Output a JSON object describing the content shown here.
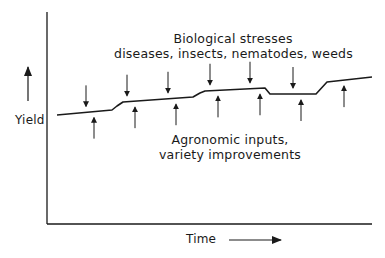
{
  "diagram": {
    "top_label": {
      "line1": "Biological stresses",
      "line2": "diseases, insects, nematodes, weeds"
    },
    "bottom_label": {
      "line1": "Agronomic inputs,",
      "line2": "variety improvements"
    },
    "y_axis_label": "Yield",
    "x_axis_label": "Time",
    "colors": {
      "line": "#1a1a1a",
      "background": "#ffffff"
    },
    "yield_curve_points": [
      [
        57,
        115
      ],
      [
        112,
        110
      ],
      [
        117,
        106
      ],
      [
        123,
        102
      ],
      [
        193,
        97
      ],
      [
        200,
        93
      ],
      [
        205,
        91
      ],
      [
        265,
        88
      ],
      [
        270,
        94
      ],
      [
        316,
        94
      ],
      [
        327,
        82
      ],
      [
        372,
        77
      ]
    ],
    "down_arrows_x": [
      86,
      127,
      168,
      210,
      250,
      293
    ],
    "up_arrows_x": [
      94,
      135,
      176,
      218,
      260,
      301,
      344
    ]
  }
}
